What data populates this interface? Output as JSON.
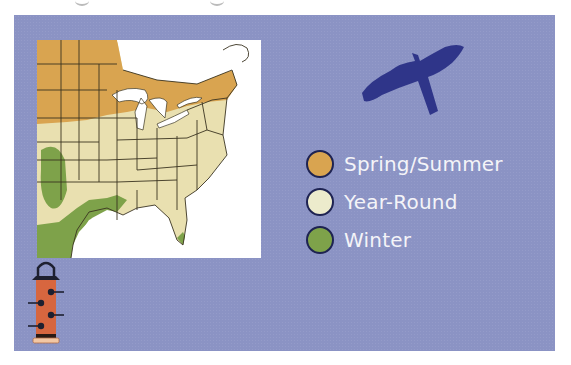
{
  "map": {
    "region": "Eastern United States range map",
    "colors": {
      "background_water": "#ffffff",
      "spring_summer": "#d9a450",
      "year_round": "#e9e0b0",
      "winter": "#7ea24a",
      "borders": "#3a3320"
    }
  },
  "legend": {
    "items": [
      {
        "label": "Spring/Summer",
        "color": "#d9a450"
      },
      {
        "label": "Year-Round",
        "color": "#ecebcc"
      },
      {
        "label": "Winter",
        "color": "#7ea24a"
      }
    ]
  },
  "icons": {
    "bird": "hawk-silhouette-icon",
    "feeder": "tube-feeder-icon"
  },
  "theme": {
    "panel_bg": "#8b93c4",
    "bird_color": "#2f3589",
    "feeder_color": "#d7663f",
    "legend_text": "#f4f4f8"
  }
}
